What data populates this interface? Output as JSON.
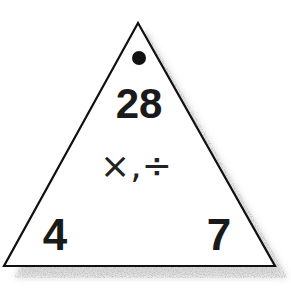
{
  "fact_triangle": {
    "operation_label": "×,÷",
    "top_value": "28",
    "bottom_left_value": "4",
    "bottom_right_value": "7",
    "top_marker": "dot",
    "colors": {
      "outline": "#111111",
      "text": "#1a1a1a",
      "shadow": "#9a9a9a",
      "background": "#ffffff"
    }
  }
}
